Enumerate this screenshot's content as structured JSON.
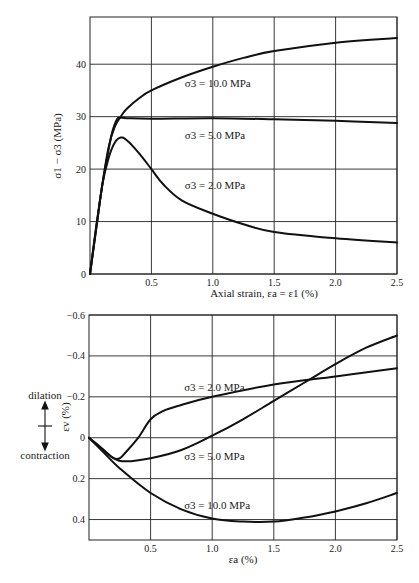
{
  "chart_data": [
    {
      "type": "line",
      "title": "",
      "xlabel": "Axial strain, εa = ε1 (%)",
      "ylabel": "σ1 − σ3 (MPa)",
      "xlim": [
        0,
        2.5
      ],
      "ylim": [
        0,
        49
      ],
      "xticks": [
        0.5,
        1.0,
        1.5,
        2.0,
        2.5
      ],
      "xtick_labels": [
        "0.5",
        "1.0",
        "1.5",
        "2.0",
        "2.5"
      ],
      "yticks": [
        0,
        10,
        20,
        30,
        40
      ],
      "ytick_labels": [
        "0",
        "10",
        "20",
        "30",
        "40"
      ],
      "grid": true,
      "legend": "inline labels",
      "series": [
        {
          "name": "σ3 = 10.0 MPa",
          "label_pos": [
            1.0,
            36.5
          ],
          "x": [
            0,
            0.05,
            0.1,
            0.15,
            0.2,
            0.25,
            0.3,
            0.4,
            0.5,
            0.75,
            1.0,
            1.25,
            1.5,
            2.0,
            2.5
          ],
          "y": [
            0,
            9,
            17,
            24,
            28,
            30,
            31.5,
            33.5,
            35,
            37.5,
            39.5,
            41.2,
            42.5,
            44.1,
            45
          ]
        },
        {
          "name": "σ3 = 5.0 MPa",
          "label_pos": [
            1.0,
            26.5
          ],
          "x": [
            0,
            0.05,
            0.1,
            0.15,
            0.18,
            0.22,
            0.25,
            0.3,
            0.5,
            1.0,
            1.5,
            2.0,
            2.5
          ],
          "y": [
            0,
            8.5,
            17,
            23.5,
            27,
            29.5,
            29.8,
            29.7,
            29.6,
            29.7,
            29.5,
            29.2,
            28.8
          ]
        },
        {
          "name": "σ3 = 2.0 MPa",
          "label_pos": [
            1.0,
            17
          ],
          "x": [
            0,
            0.05,
            0.1,
            0.15,
            0.2,
            0.25,
            0.3,
            0.4,
            0.5,
            0.6,
            0.75,
            1.0,
            1.25,
            1.5,
            2.0,
            2.5
          ],
          "y": [
            0,
            8.5,
            17,
            22,
            25,
            26,
            25.5,
            23,
            20,
            17,
            14,
            11.5,
            9.5,
            8,
            6.8,
            6
          ]
        }
      ]
    },
    {
      "type": "line",
      "title": "",
      "xlabel": "εa (%)",
      "ylabel": "εv (%)",
      "xlim": [
        0,
        2.5
      ],
      "ylim": [
        0.5,
        -0.6
      ],
      "y_inverted": true,
      "xticks": [
        0.5,
        1.0,
        1.5,
        2.0,
        2.5
      ],
      "xtick_labels": [
        "0.5",
        "1.0",
        "1.5",
        "2.0",
        "2.5"
      ],
      "yticks": [
        -0.6,
        -0.4,
        -0.2,
        0,
        0.2,
        0.4
      ],
      "ytick_labels": [
        "−0.6",
        "−0.4",
        "−0.2",
        "0",
        "0.2",
        "0.4"
      ],
      "grid": true,
      "annotations": [
        "dilation",
        "contraction"
      ],
      "series": [
        {
          "name": "σ3 = 2.0 MPa",
          "label_pos": [
            1.0,
            -0.25
          ],
          "x": [
            0,
            0.1,
            0.2,
            0.25,
            0.3,
            0.4,
            0.5,
            0.6,
            0.75,
            1.0,
            1.5,
            2.0,
            2.5
          ],
          "y": [
            0,
            0.05,
            0.1,
            0.1,
            0.07,
            0.0,
            -0.09,
            -0.13,
            -0.16,
            -0.2,
            -0.26,
            -0.3,
            -0.34
          ]
        },
        {
          "name": "σ3 = 5.0 MPa",
          "label_pos": [
            1.0,
            0.09
          ],
          "x": [
            0,
            0.1,
            0.2,
            0.3,
            0.5,
            0.75,
            1.0,
            1.25,
            1.5,
            1.75,
            2.0,
            2.25,
            2.5
          ],
          "y": [
            0,
            0.05,
            0.1,
            0.115,
            0.1,
            0.06,
            -0.01,
            -0.09,
            -0.18,
            -0.27,
            -0.36,
            -0.44,
            -0.5
          ]
        },
        {
          "name": "σ3 = 10.0 MPa",
          "label_pos": [
            1.0,
            0.33
          ],
          "x": [
            0,
            0.1,
            0.25,
            0.5,
            0.75,
            1.0,
            1.25,
            1.5,
            1.75,
            2.0,
            2.25,
            2.5
          ],
          "y": [
            0,
            0.06,
            0.15,
            0.27,
            0.35,
            0.395,
            0.41,
            0.41,
            0.39,
            0.36,
            0.32,
            0.27
          ]
        }
      ]
    }
  ],
  "labels": {
    "top_ylabel": "σ1 − σ3 (MPa)",
    "top_xlabel": "Axial strain, εa = ε1 (%)",
    "bottom_ylabel": "εv (%)",
    "bottom_xlabel": "εa (%)",
    "dilation": "dilation",
    "contraction": "contraction"
  }
}
